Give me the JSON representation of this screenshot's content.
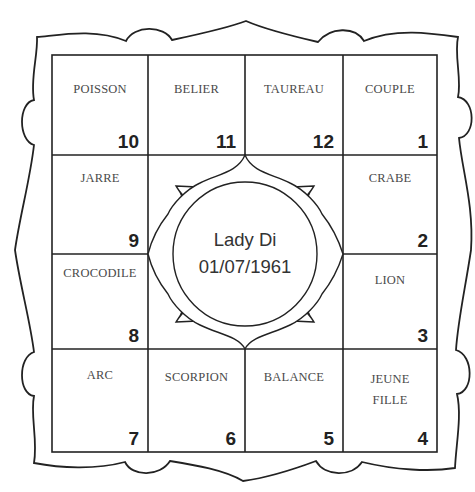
{
  "chart": {
    "center": {
      "name": "Lady Di",
      "date": "01/07/1961"
    },
    "houses": [
      {
        "sign": "POISSON",
        "number": "10"
      },
      {
        "sign": "BELIER",
        "number": "11"
      },
      {
        "sign": "TAUREAU",
        "number": "12"
      },
      {
        "sign": "COUPLE",
        "number": "1"
      },
      {
        "sign": "JARRE",
        "number": "9"
      },
      {
        "sign": "CRABE",
        "number": "2"
      },
      {
        "sign": "CROCODILE",
        "number": "8"
      },
      {
        "sign": "LION",
        "number": "3"
      },
      {
        "sign": "ARC",
        "number": "7"
      },
      {
        "sign": "SCORPION",
        "number": "6"
      },
      {
        "sign": "BALANCE",
        "number": "5"
      },
      {
        "sign": "JEUNE\nFILLE",
        "number": "4"
      }
    ],
    "colors": {
      "line": "#222222",
      "sign_text": "#4a4a4a",
      "number_text": "#222222"
    }
  }
}
